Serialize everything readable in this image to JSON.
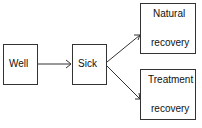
{
  "diagram": {
    "type": "flowchart",
    "nodes": [
      {
        "id": "well",
        "label": "Well"
      },
      {
        "id": "sick",
        "label": "Sick"
      },
      {
        "id": "natural",
        "label_line1": "Natural",
        "label_line2": "recovery"
      },
      {
        "id": "treatment",
        "label_line1": "Treatment",
        "label_line2": "recovery"
      }
    ],
    "edges": [
      {
        "from": "well",
        "to": "sick"
      },
      {
        "from": "sick",
        "to": "natural"
      },
      {
        "from": "sick",
        "to": "treatment"
      }
    ],
    "colors": {
      "stroke": "#333333",
      "text": "#111111",
      "background": "#ffffff"
    }
  }
}
